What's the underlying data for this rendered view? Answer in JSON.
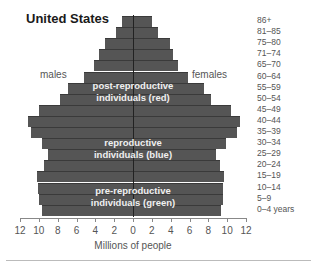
{
  "chart_data": {
    "type": "bar",
    "subtype": "population-pyramid",
    "title": "United States",
    "xlabel": "Millions of people",
    "ylabel": "",
    "left_label": "males",
    "right_label": "females",
    "age_unit": "years",
    "xlim": [
      -12,
      12
    ],
    "x_ticks": [
      "12",
      "10",
      "8",
      "6",
      "4",
      "2",
      "0",
      "2",
      "4",
      "6",
      "8",
      "10",
      "12"
    ],
    "categories": [
      "86+",
      "81–85",
      "75–80",
      "71–74",
      "65–70",
      "60–64",
      "55–59",
      "50–54",
      "45–49",
      "40–44",
      "35–39",
      "30–34",
      "25–29",
      "20–24",
      "15–19",
      "10–14",
      "5–9",
      "0–4"
    ],
    "series": [
      {
        "name": "males",
        "values": [
          1.2,
          1.8,
          3.0,
          3.6,
          4.1,
          5.2,
          6.9,
          7.8,
          10.0,
          11.1,
          10.8,
          9.7,
          9.0,
          9.4,
          10.2,
          10.1,
          10.0,
          9.7
        ]
      },
      {
        "name": "females",
        "values": [
          2.0,
          2.7,
          3.9,
          4.3,
          4.8,
          5.8,
          7.5,
          8.3,
          10.4,
          11.4,
          11.0,
          9.9,
          8.8,
          9.2,
          9.7,
          9.6,
          9.6,
          9.3
        ]
      }
    ],
    "annotations": [
      {
        "text": "post-reproductive individuals (red)",
        "line1": "post-reproductive",
        "line2": "individuals (red)"
      },
      {
        "text": "reproductive individuals (blue)",
        "line1": "reproductive",
        "line2": "individuals (blue)"
      },
      {
        "text": "pre-reproductive individuals (green)",
        "line1": "pre-reproductive",
        "line2": "individuals (green)"
      }
    ],
    "bar_color": "#555555",
    "grid": false,
    "legend": "none"
  }
}
